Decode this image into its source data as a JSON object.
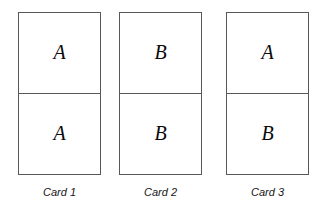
{
  "figure": {
    "background_color": "#ffffff",
    "line_color": "#585858",
    "text_color": "#0a0a0a",
    "cards": [
      {
        "id": "card-1",
        "caption": "Card 1",
        "top_letter": "A",
        "bottom_letter": "A"
      },
      {
        "id": "card-2",
        "caption": "Card 2",
        "top_letter": "B",
        "bottom_letter": "B"
      },
      {
        "id": "card-3",
        "caption": "Card 3",
        "top_letter": "A",
        "bottom_letter": "B"
      }
    ]
  }
}
